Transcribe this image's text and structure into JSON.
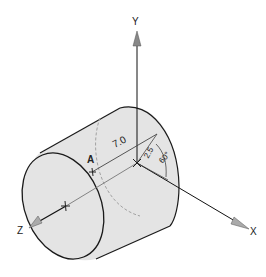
{
  "diagram": {
    "type": "3D cylinder with coordinate axes",
    "axes": {
      "x_label": "X",
      "y_label": "Y",
      "z_label": "Z"
    },
    "point_label": "A",
    "dimensions": {
      "length": "7.0",
      "radius": "2.5",
      "angle": "60°"
    },
    "colors": {
      "fill": "#e4e4e4",
      "outline": "#1a1a1a",
      "axis": "#111111",
      "hidden": "#9a9a9a"
    }
  }
}
